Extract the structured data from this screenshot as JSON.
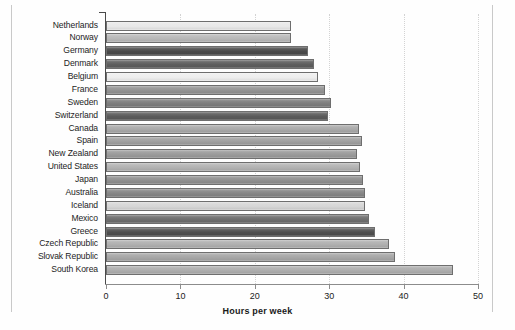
{
  "chart_data": {
    "type": "bar",
    "orientation": "horizontal",
    "title": "",
    "xlabel": "Hours per week",
    "ylabel": "",
    "xlim": [
      0,
      50
    ],
    "ylim": null,
    "grid": "vertical-dotted",
    "legend": "none",
    "xticks": [
      0,
      10,
      20,
      30,
      40,
      50
    ],
    "xticklabels": [
      "0",
      "10",
      "20",
      "30",
      "40",
      "50"
    ],
    "categories": [
      "Netherlands",
      "Norway",
      "Germany",
      "Denmark",
      "Belgium",
      "France",
      "Sweden",
      "Switzerland",
      "Canada",
      "Spain",
      "New Zealand",
      "United States",
      "Japan",
      "Australia",
      "Iceland",
      "Mexico",
      "Greece",
      "Czech Republic",
      "Slovak Republic",
      "South Korea"
    ],
    "values": [
      24.8,
      24.9,
      27.2,
      27.9,
      28.5,
      29.4,
      30.2,
      29.8,
      34.0,
      34.4,
      33.8,
      34.1,
      34.5,
      34.8,
      34.8,
      35.3,
      36.2,
      38.0,
      38.8,
      46.6
    ],
    "bar_colors": [
      "#e8e8e8",
      "#b9b9b9",
      "#4a4a4a",
      "#5e5e5e",
      "#eeeeee",
      "#939393",
      "#7d7d7d",
      "#5a5a5a",
      "#a9a9a9",
      "#a0a0a0",
      "#9b9b9b",
      "#b3b3b3",
      "#8f8f8f",
      "#868686",
      "#d6d6d6",
      "#6f6f6f",
      "#4f4f4f",
      "#b0b0b0",
      "#a6a6a6",
      "#adadad"
    ]
  },
  "axis": {
    "x_title": "Hours per week"
  },
  "colors": {
    "background": "#ffffff",
    "axis": "#4a4a4a",
    "grid": "#d3d3d3",
    "bar_border": "#6e6e6e",
    "text": "#1d1d1d"
  }
}
